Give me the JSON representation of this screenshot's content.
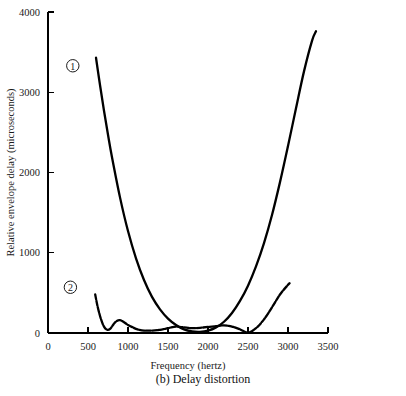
{
  "chart_data": {
    "type": "line",
    "title": "",
    "caption": "(b) Delay distortion",
    "xlabel": "Frequency (hertz)",
    "ylabel": "Relative envelope delay (microseconds)",
    "xlim": [
      0,
      3500
    ],
    "ylim": [
      0,
      4000
    ],
    "xticks": [
      0,
      500,
      1000,
      1500,
      2000,
      2500,
      3000,
      3500
    ],
    "xtick_labels": [
      "0",
      "500",
      "1000",
      "1500",
      "2000",
      "2500",
      "3000",
      "3500"
    ],
    "yticks": [
      0,
      1000,
      2000,
      3000,
      4000
    ],
    "ytick_labels": [
      "0",
      "1000",
      "2000",
      "3000",
      "4000"
    ],
    "grid": false,
    "legend_position": "inline-markers",
    "series": [
      {
        "name": "1",
        "marker_label": "1",
        "marker_x": 310,
        "marker_y": 3330,
        "style": "solid",
        "color": "#000000",
        "x": [
          600,
          650,
          700,
          750,
          800,
          900,
          1000,
          1100,
          1200,
          1300,
          1400,
          1500,
          1600,
          1700,
          1800,
          1900,
          2000,
          2100,
          2200,
          2300,
          2400,
          2500,
          2600,
          2700,
          2800,
          2900,
          3000,
          3100,
          3200,
          3300,
          3350
        ],
        "y": [
          3430,
          3090,
          2770,
          2470,
          2190,
          1690,
          1270,
          930,
          660,
          450,
          295,
          180,
          100,
          45,
          20,
          15,
          30,
          70,
          140,
          250,
          400,
          590,
          830,
          1120,
          1470,
          1880,
          2330,
          2800,
          3260,
          3640,
          3760
        ]
      },
      {
        "name": "2",
        "marker_label": "2",
        "marker_x": 280,
        "marker_y": 570,
        "style": "beaded",
        "color": "#000000",
        "x": [
          590,
          620,
          660,
          700,
          740,
          780,
          820,
          860,
          900,
          950,
          1000,
          1060,
          1120,
          1200,
          1300,
          1400,
          1500,
          1600,
          1700,
          1800,
          1900,
          2000,
          2100,
          2200,
          2300,
          2400,
          2500,
          2600,
          2700,
          2800,
          2900,
          3000,
          3020
        ],
        "y": [
          480,
          330,
          180,
          80,
          40,
          55,
          110,
          150,
          160,
          135,
          100,
          70,
          45,
          30,
          30,
          40,
          60,
          80,
          70,
          60,
          65,
          75,
          85,
          95,
          80,
          45,
          5,
          60,
          170,
          320,
          480,
          600,
          620
        ]
      }
    ]
  },
  "figure": {
    "background_color": "#ffffff",
    "axis_color": "#000000"
  }
}
